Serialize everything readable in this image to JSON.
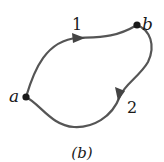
{
  "diagram": {
    "caption": "(b)",
    "points": [
      {
        "id": "a",
        "label": "a",
        "x": 26,
        "y": 97
      },
      {
        "id": "b",
        "label": "b",
        "x": 137,
        "y": 25
      }
    ],
    "paths": [
      {
        "id": "path-1",
        "label": "1",
        "from": "a",
        "to": "b",
        "direction": "a-to-b"
      },
      {
        "id": "path-2",
        "label": "2",
        "from": "b",
        "to": "a",
        "direction": "b-to-a"
      }
    ],
    "colors": {
      "stroke": "#555555",
      "point": "#1a1a1a",
      "text": "#1a1a1a"
    }
  }
}
